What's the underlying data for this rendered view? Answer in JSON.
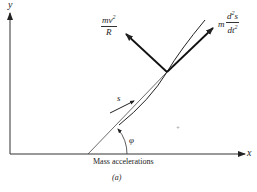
{
  "figure": {
    "caption": "Mass accelerations",
    "sublabel": "(a)",
    "axes": {
      "x_label": "x",
      "y_label": "y"
    },
    "vectors": {
      "normal": {
        "numerator": "mv",
        "exponent": "2",
        "denominator": "R"
      },
      "tangential": {
        "prefix": "m",
        "numerator": "d",
        "num_exp": "2",
        "num_var": "s",
        "denominator": "dt",
        "den_exp": "2"
      }
    },
    "arc_length_label": "s",
    "angle_label": "φ",
    "colors": {
      "ink": "#222222",
      "background": "#ffffff"
    }
  }
}
